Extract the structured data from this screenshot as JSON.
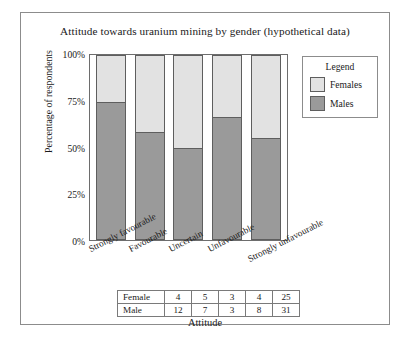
{
  "chart_data": {
    "type": "bar",
    "subtype": "stacked-100-percent",
    "title": "Attitude towards uranium mining by gender (hypothetical data)",
    "xlabel": "Attitude",
    "ylabel": "Percentage of respondents",
    "categories": [
      "Strongly favourable",
      "Favourable",
      "Uncertain",
      "Unfavourable",
      "Strongly unfavourable"
    ],
    "series": [
      {
        "name": "Females",
        "color": "#e2e2e2",
        "values": [
          4,
          5,
          3,
          4,
          25
        ]
      },
      {
        "name": "Males",
        "color": "#9a9a9a",
        "values": [
          12,
          7,
          3,
          8,
          31
        ]
      }
    ],
    "percentages": {
      "Females": [
        25.0,
        41.7,
        50.0,
        33.3,
        44.6
      ],
      "Males": [
        75.0,
        58.3,
        50.0,
        66.7,
        55.4
      ]
    },
    "ytick_labels": [
      "0%",
      "25%",
      "50%",
      "75%",
      "100%"
    ],
    "ytick_values": [
      0,
      25,
      50,
      75,
      100
    ],
    "ylim": [
      0,
      100
    ],
    "grid": false,
    "legend_position": "right",
    "legend_title": "Legend"
  },
  "legend": {
    "title": "Legend",
    "entries": [
      {
        "label": "Females",
        "color": "#e2e2e2"
      },
      {
        "label": "Males",
        "color": "#9a9a9a"
      }
    ]
  },
  "table": {
    "rows": [
      {
        "header": "Female",
        "values": [
          "4",
          "5",
          "3",
          "4",
          "25"
        ]
      },
      {
        "header": "Male",
        "values": [
          "12",
          "7",
          "3",
          "8",
          "31"
        ]
      }
    ]
  }
}
